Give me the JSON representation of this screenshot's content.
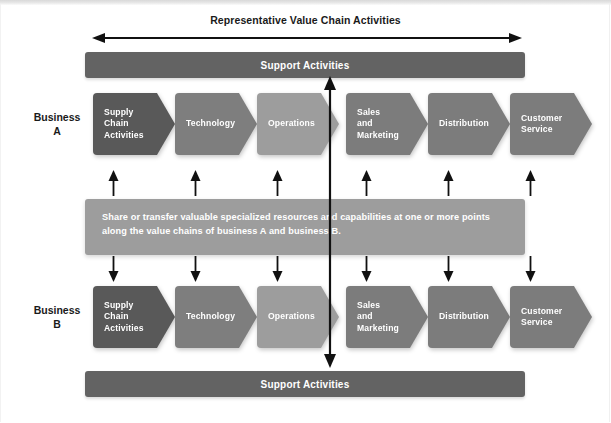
{
  "diagram": {
    "caption": "Representative Value Chain Activities",
    "support_bar_top_label": "Support Activities",
    "support_bar_bottom_label": "Support Activities",
    "share_text": "Share or transfer valuable specialized resources and capabilities at one or more points along the value chains of business A and business B.",
    "business_a": {
      "label_line1": "Business",
      "label_line2": "A",
      "activities": [
        {
          "label": "Supply Chain Activities",
          "lines": [
            "Supply",
            "Chain",
            "Activities"
          ],
          "color": "#595959",
          "x": 0,
          "width": 82
        },
        {
          "label": "Technology",
          "lines": [
            "Technology"
          ],
          "color": "#7e7e7e",
          "x": 82,
          "width": 82
        },
        {
          "label": "Operations",
          "lines": [
            "Operations"
          ],
          "color": "#9d9d9d",
          "x": 164,
          "width": 82
        },
        {
          "label": "Sales and Marketing",
          "lines": [
            "Sales",
            "and",
            "Marketing"
          ],
          "color": "#7c7c7c",
          "x": 253,
          "width": 82
        },
        {
          "label": "Distribution",
          "lines": [
            "Distribution"
          ],
          "color": "#7c7c7c",
          "x": 335,
          "width": 82
        },
        {
          "label": "Customer Service",
          "lines": [
            "Customer",
            "Service"
          ],
          "color": "#7c7c7c",
          "x": 417,
          "width": 82
        }
      ]
    },
    "business_b": {
      "label_line1": "Business",
      "label_line2": "B",
      "activities": [
        {
          "label": "Supply Chain Activities",
          "lines": [
            "Supply",
            "Chain",
            "Activities"
          ],
          "color": "#595959",
          "x": 0,
          "width": 82
        },
        {
          "label": "Technology",
          "lines": [
            "Technology"
          ],
          "color": "#7e7e7e",
          "x": 82,
          "width": 82
        },
        {
          "label": "Operations",
          "lines": [
            "Operations"
          ],
          "color": "#9d9d9d",
          "x": 164,
          "width": 82
        },
        {
          "label": "Sales and Marketing",
          "lines": [
            "Sales",
            "and",
            "Marketing"
          ],
          "color": "#7c7c7c",
          "x": 253,
          "width": 82
        },
        {
          "label": "Distribution",
          "lines": [
            "Distribution"
          ],
          "color": "#7c7c7c",
          "x": 335,
          "width": 82
        },
        {
          "label": "Customer Service",
          "lines": [
            "Customer",
            "Service"
          ],
          "color": "#7c7c7c",
          "x": 417,
          "width": 82
        }
      ]
    },
    "connector_arrows_up": {
      "count": 6,
      "direction": "up",
      "x_positions": [
        108,
        190,
        272,
        361,
        443,
        525
      ]
    },
    "connector_arrows_down": {
      "count": 6,
      "direction": "down",
      "x_positions": [
        108,
        190,
        272,
        361,
        443,
        525
      ]
    },
    "center_arrow": {
      "direction": "both",
      "label": "vertical-linkage-arrow"
    },
    "range_arrow": {
      "direction": "both",
      "label": "value-chain-span-arrow"
    },
    "colors": {
      "support_bar": "#636363",
      "share_block": "#9d9d9d",
      "chevron_dark": "#595959",
      "chevron_mid": "#7c7c7c",
      "chevron_light": "#9d9d9d",
      "text_on_fill": "#ffffff",
      "text_dark": "#1a1a1a",
      "background": "#ffffff"
    }
  }
}
